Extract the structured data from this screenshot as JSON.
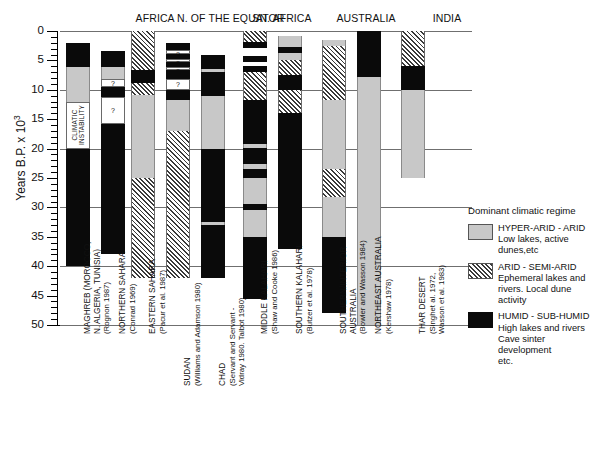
{
  "chart_data": {
    "type": "bar",
    "title": "",
    "ylabel": "Years B.P. x 10",
    "ylabel_exponent": "3",
    "ylim": [
      0,
      50
    ],
    "y_ticks": [
      0,
      5,
      10,
      15,
      20,
      25,
      30,
      35,
      40,
      45,
      50
    ],
    "y_gridlines": [
      0,
      10,
      20,
      30,
      40,
      50
    ],
    "y_inverted": true,
    "grid": true,
    "legend_position": "right-bottom",
    "regions": [
      {
        "label": "AFRICA N. OF THE EQUATOR",
        "columns": 5
      },
      {
        "label": "SN. AFRICA",
        "columns": 2
      },
      {
        "label": "AUSTRALIA",
        "columns": 2
      },
      {
        "label": "INDIA",
        "columns": 1
      }
    ],
    "categories": [
      "MAGHREB (MOROCCO, N. ALGERIA, TUNISIA)",
      "NORTHERN SAHARA",
      "EASTERN SAHARA",
      "SUDAN",
      "CHAD",
      "MIDDLE KALAHARI",
      "SOUTHERN KALAHARI",
      "SOUTHERN/INTERIOR AUSTRALIA",
      "NORTHEAST AUSTRALIA",
      "THAR DESERT"
    ],
    "column_labels": [
      {
        "name": "MAGHREB (MOROCCO,",
        "name2": "N. ALGERIA, TUNISIA)",
        "ref": "(Rognon 1987)"
      },
      {
        "name": "NORTHERN SAHARA",
        "ref": "(Conrad 1969)"
      },
      {
        "name": "EASTERN SAHARA",
        "ref": "(Pacur et al. 1987)"
      },
      {
        "name": "SUDAN",
        "ref": "(Williams and Adamson 1980)"
      },
      {
        "name": "CHAD",
        "ref": "(Servant and Servant -",
        "ref2": "Vidray 1980. Talbot 1980)"
      },
      {
        "name": "MIDDLE KALAHARI",
        "ref": "(Shaw and Cooke 1986)"
      },
      {
        "name": "SOUTHERN KALAHARI",
        "ref": "(Butzer et al. 1978)"
      },
      {
        "name": "SOUTHERN/INTERIOR",
        "name2": "AUSTRALIA",
        "ref": "(Bowler and Wasson 1984)"
      },
      {
        "name": "NORTHEAST AUSTRALIA",
        "ref": "(Kershaw 1978)"
      },
      {
        "name": "THAR DESERT",
        "ref": "(Singhet al. 1972,",
        "ref2": "Wasson et al. 1983)"
      }
    ],
    "series": [
      {
        "name": "MAGHREB (MOROCCO, N. ALGERIA, TUNISIA)",
        "segments": [
          {
            "from": 2.0,
            "to": 6.1,
            "regime": "humid"
          },
          {
            "from": 6.1,
            "to": 12.1,
            "regime": "hyper-arid"
          },
          {
            "from": 12.1,
            "to": 20.0,
            "regime": "instability",
            "label": "CLIMATIC INSTABILITY"
          },
          {
            "from": 20.0,
            "to": 40.0,
            "regime": "humid"
          }
        ]
      },
      {
        "name": "NORTHERN SAHARA",
        "segments": [
          {
            "from": 3.4,
            "to": 6.1,
            "regime": "humid"
          },
          {
            "from": 6.1,
            "to": 8.1,
            "regime": "hyper-arid"
          },
          {
            "from": 8.1,
            "to": 9.6,
            "regime": "instability",
            "label": "?"
          },
          {
            "from": 9.6,
            "to": 11.2,
            "regime": "humid"
          },
          {
            "from": 11.2,
            "to": 15.8,
            "regime": "instability",
            "label": "?"
          },
          {
            "from": 15.8,
            "to": 38.0,
            "regime": "humid"
          }
        ]
      },
      {
        "name": "EASTERN SAHARA",
        "segments": [
          {
            "from": 0.0,
            "to": 6.6,
            "regime": "arid"
          },
          {
            "from": 6.6,
            "to": 8.8,
            "regime": "humid"
          },
          {
            "from": 8.8,
            "to": 10.9,
            "regime": "arid"
          },
          {
            "from": 10.9,
            "to": 25.0,
            "regime": "hyper-arid"
          },
          {
            "from": 25.0,
            "to": 42.0,
            "regime": "arid"
          }
        ]
      },
      {
        "name": "SUDAN",
        "segments": [
          {
            "from": 2.0,
            "to": 3.3,
            "regime": "humid"
          },
          {
            "from": 3.3,
            "to": 3.9,
            "regime": "instability",
            "label": "?"
          },
          {
            "from": 3.9,
            "to": 4.7,
            "regime": "humid"
          },
          {
            "from": 4.7,
            "to": 5.3,
            "regime": "instability",
            "label": "?"
          },
          {
            "from": 5.3,
            "to": 6.1,
            "regime": "humid"
          },
          {
            "from": 6.1,
            "to": 6.7,
            "regime": "instability",
            "label": "?"
          },
          {
            "from": 6.7,
            "to": 8.2,
            "regime": "humid"
          },
          {
            "from": 8.2,
            "to": 10.0,
            "regime": "instability",
            "label": "?"
          },
          {
            "from": 10.0,
            "to": 11.8,
            "regime": "humid"
          },
          {
            "from": 11.8,
            "to": 17.0,
            "regime": "hyper-arid"
          },
          {
            "from": 17.0,
            "to": 42.0,
            "regime": "arid"
          }
        ]
      },
      {
        "name": "CHAD",
        "segments": [
          {
            "from": 4.0,
            "to": 6.5,
            "regime": "humid"
          },
          {
            "from": 6.5,
            "to": 7.0,
            "regime": "hyper-arid"
          },
          {
            "from": 7.0,
            "to": 11.1,
            "regime": "humid"
          },
          {
            "from": 11.1,
            "to": 20.0,
            "regime": "hyper-arid"
          },
          {
            "from": 20.0,
            "to": 32.4,
            "regime": "humid"
          },
          {
            "from": 32.4,
            "to": 33.0,
            "regime": "hyper-arid"
          },
          {
            "from": 33.0,
            "to": 42.0,
            "regime": "humid"
          }
        ]
      },
      {
        "name": "MIDDLE KALAHARI",
        "segments": [
          {
            "from": 0.0,
            "to": 1.9,
            "regime": "arid"
          },
          {
            "from": 1.9,
            "to": 2.9,
            "regime": "humid"
          },
          {
            "from": 4.3,
            "to": 5.3,
            "regime": "humid"
          },
          {
            "from": 6.0,
            "to": 7.0,
            "regime": "humid"
          },
          {
            "from": 7.0,
            "to": 11.8,
            "regime": "arid"
          },
          {
            "from": 11.8,
            "to": 19.2,
            "regime": "humid"
          },
          {
            "from": 19.2,
            "to": 19.9,
            "regime": "hyper-arid"
          },
          {
            "from": 19.9,
            "to": 22.7,
            "regime": "humid"
          },
          {
            "from": 22.7,
            "to": 23.4,
            "regime": "hyper-arid"
          },
          {
            "from": 23.4,
            "to": 25.0,
            "regime": "humid"
          },
          {
            "from": 25.0,
            "to": 29.4,
            "regime": "hyper-arid"
          },
          {
            "from": 29.4,
            "to": 30.5,
            "regime": "humid"
          },
          {
            "from": 30.5,
            "to": 35.0,
            "regime": "hyper-arid"
          },
          {
            "from": 35.0,
            "to": 45.5,
            "regime": "humid"
          }
        ]
      },
      {
        "name": "SOUTHERN KALAHARI",
        "segments": [
          {
            "from": 0.8,
            "to": 2.8,
            "regime": "hyper-arid"
          },
          {
            "from": 2.8,
            "to": 3.8,
            "regime": "humid"
          },
          {
            "from": 3.8,
            "to": 5.0,
            "regime": "hyper-arid"
          },
          {
            "from": 5.0,
            "to": 7.4,
            "regime": "arid"
          },
          {
            "from": 7.4,
            "to": 10.0,
            "regime": "humid"
          },
          {
            "from": 10.0,
            "to": 14.0,
            "regime": "arid"
          },
          {
            "from": 14.0,
            "to": 37.0,
            "regime": "humid"
          }
        ]
      },
      {
        "name": "SOUTHERN/INTERIOR AUSTRALIA",
        "segments": [
          {
            "from": 1.5,
            "to": 2.5,
            "regime": "hyper-arid"
          },
          {
            "from": 2.5,
            "to": 11.8,
            "regime": "arid"
          },
          {
            "from": 11.8,
            "to": 23.5,
            "regime": "hyper-arid"
          },
          {
            "from": 23.5,
            "to": 28.2,
            "regime": "arid"
          },
          {
            "from": 28.2,
            "to": 35.1,
            "regime": "hyper-arid"
          },
          {
            "from": 35.1,
            "to": 48.0,
            "regime": "humid"
          }
        ]
      },
      {
        "name": "NORTHEAST AUSTRALIA",
        "segments": [
          {
            "from": 0.0,
            "to": 7.9,
            "regime": "humid"
          },
          {
            "from": 7.9,
            "to": 50.0,
            "regime": "hyper-arid"
          }
        ]
      },
      {
        "name": "THAR DESERT",
        "segments": [
          {
            "from": 0.0,
            "to": 5.9,
            "regime": "arid"
          },
          {
            "from": 5.9,
            "to": 10.0,
            "regime": "humid"
          },
          {
            "from": 10.0,
            "to": 25.0,
            "regime": "hyper-arid"
          }
        ]
      }
    ]
  },
  "legend": {
    "title": "Dominant climatic regime",
    "items": [
      {
        "swatch": "gray",
        "heading": "HYPER-ARID - ARID",
        "desc1": "Low lakes, active",
        "desc2": "dunes,etc",
        "desc3": ""
      },
      {
        "swatch": "hatch",
        "heading": "ARID - SEMI-ARID",
        "desc1": "Ephemeral lakes and",
        "desc2": "rivers. Local dune activity",
        "desc3": ""
      },
      {
        "swatch": "black",
        "heading": "HUMID - SUB-HUMID",
        "desc1": "High lakes and rivers",
        "desc2": "Cave sinter development",
        "desc3": "etc."
      }
    ]
  },
  "colors": {
    "hyper_arid": "#c8c8c8",
    "arid": "#ffffff",
    "humid": "#0a0a0a",
    "axis": "#000000",
    "grid": "#6f6f6f"
  }
}
